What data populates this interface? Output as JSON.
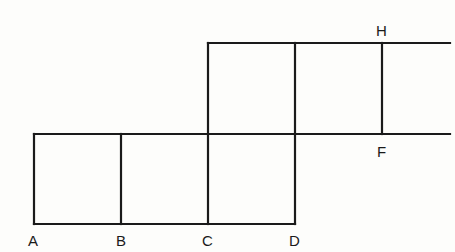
{
  "figure": {
    "type": "geometric-net",
    "stroke_color": "#1a1a1a",
    "background": "#fdfdfb"
  },
  "labels": {
    "A": "A",
    "B": "B",
    "C": "C",
    "D": "D",
    "H": "H",
    "F": "F"
  },
  "points": {
    "A": [
      34,
      224
    ],
    "B": [
      121,
      224
    ],
    "C": [
      208,
      224
    ],
    "D": [
      295,
      224
    ],
    "H": [
      382,
      43
    ],
    "F": [
      382,
      134
    ]
  }
}
